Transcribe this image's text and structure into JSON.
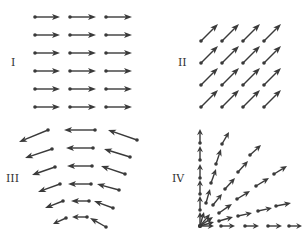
{
  "figure": {
    "colors": {
      "ink": "#3a3a3a",
      "background": "#ffffff"
    },
    "panels": [
      {
        "id": "I",
        "label": "I",
        "label_pos": [
          11,
          66
        ],
        "kind": "uniform horizontal field pointing right",
        "arrows": [
          [
            35,
            17,
            60,
            17
          ],
          [
            70,
            17,
            96,
            17
          ],
          [
            106,
            17,
            132,
            17
          ],
          [
            35,
            35,
            60,
            35
          ],
          [
            70,
            35,
            96,
            35
          ],
          [
            106,
            35,
            132,
            35
          ],
          [
            35,
            53,
            60,
            53
          ],
          [
            70,
            53,
            96,
            53
          ],
          [
            106,
            53,
            132,
            53
          ],
          [
            35,
            71,
            60,
            71
          ],
          [
            70,
            71,
            96,
            71
          ],
          [
            106,
            71,
            132,
            71
          ],
          [
            35,
            89,
            60,
            89
          ],
          [
            70,
            89,
            96,
            89
          ],
          [
            106,
            89,
            132,
            89
          ],
          [
            35,
            107,
            60,
            107
          ],
          [
            70,
            107,
            96,
            107
          ],
          [
            106,
            107,
            132,
            107
          ]
        ]
      },
      {
        "id": "II",
        "label": "II",
        "label_pos": [
          178,
          66
        ],
        "kind": "uniform diagonal field pointing up-right",
        "arrows": [
          [
            201,
            41,
            218,
            24
          ],
          [
            222,
            41,
            239,
            24
          ],
          [
            243,
            41,
            260,
            24
          ],
          [
            264,
            41,
            281,
            24
          ],
          [
            201,
            63,
            218,
            46
          ],
          [
            222,
            63,
            239,
            46
          ],
          [
            243,
            63,
            260,
            46
          ],
          [
            264,
            63,
            281,
            46
          ],
          [
            201,
            85,
            218,
            68
          ],
          [
            222,
            85,
            239,
            68
          ],
          [
            243,
            85,
            260,
            68
          ],
          [
            264,
            85,
            281,
            68
          ],
          [
            201,
            107,
            218,
            90
          ],
          [
            222,
            107,
            239,
            90
          ],
          [
            243,
            107,
            260,
            90
          ],
          [
            264,
            107,
            281,
            90
          ]
        ]
      },
      {
        "id": "III",
        "label": "III",
        "label_pos": [
          6,
          182
        ],
        "kind": "leftward field curving around",
        "arrows": [
          [
            48,
            130,
            19,
            142
          ],
          [
            95,
            130,
            64,
            130
          ],
          [
            137,
            140,
            108,
            130
          ],
          [
            52,
            149,
            25,
            158
          ],
          [
            93,
            148,
            66,
            148
          ],
          [
            130,
            157,
            104,
            149
          ],
          [
            55,
            167,
            32,
            175
          ],
          [
            92,
            166,
            67,
            166
          ],
          [
            125,
            174,
            101,
            166
          ],
          [
            60,
            184,
            38,
            192
          ],
          [
            91,
            184,
            68,
            184
          ],
          [
            119,
            190,
            97,
            184
          ],
          [
            63,
            201,
            45,
            208
          ],
          [
            89,
            201,
            71,
            201
          ],
          [
            113,
            208,
            94,
            201
          ],
          [
            66,
            218,
            53,
            224
          ],
          [
            87,
            217,
            72,
            217
          ],
          [
            106,
            227,
            90,
            218
          ]
        ]
      },
      {
        "id": "IV",
        "label": "IV",
        "label_pos": [
          172,
          182
        ],
        "kind": "radial field emanating from lower-left corner",
        "origin": [
          200,
          226
        ],
        "arrows": [
          [
            200,
            226,
            200,
            212
          ],
          [
            200,
            210,
            200,
            196
          ],
          [
            200,
            194,
            200,
            180
          ],
          [
            200,
            178,
            200,
            164
          ],
          [
            200,
            160,
            200,
            146
          ],
          [
            200,
            143,
            200,
            129
          ],
          [
            200,
            226,
            204,
            212
          ],
          [
            206,
            203,
            210,
            189
          ],
          [
            211,
            183,
            216,
            169
          ],
          [
            216,
            164,
            221,
            149
          ],
          [
            222,
            144,
            229,
            132
          ],
          [
            200,
            226,
            210,
            214
          ],
          [
            213,
            205,
            222,
            194
          ],
          [
            225,
            189,
            235,
            178
          ],
          [
            238,
            172,
            248,
            161
          ],
          [
            250,
            155,
            261,
            145
          ],
          [
            200,
            226,
            213,
            217
          ],
          [
            219,
            213,
            232,
            204
          ],
          [
            237,
            199,
            250,
            191
          ],
          [
            256,
            186,
            269,
            178
          ],
          [
            274,
            174,
            287,
            166
          ],
          [
            200,
            226,
            214,
            222
          ],
          [
            219,
            221,
            233,
            217
          ],
          [
            238,
            216,
            252,
            213
          ],
          [
            258,
            211,
            272,
            208
          ],
          [
            276,
            206,
            291,
            203
          ],
          [
            200,
            226,
            214,
            226
          ],
          [
            221,
            226,
            235,
            226
          ],
          [
            245,
            226,
            259,
            226
          ],
          [
            268,
            226,
            282,
            226
          ],
          [
            289,
            226,
            302,
            226
          ]
        ]
      }
    ]
  }
}
